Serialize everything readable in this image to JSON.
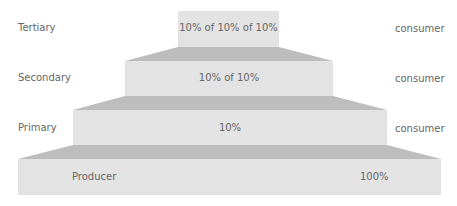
{
  "diagram": {
    "type": "energy pyramid",
    "levels": [
      {
        "left_label": "Tertiary",
        "value": "10% of 10% of 10%",
        "right_label": "consumer"
      },
      {
        "left_label": "Secondary",
        "value": "10% of 10%",
        "right_label": "consumer"
      },
      {
        "left_label": "Primary",
        "value": "10%",
        "right_label": "consumer"
      },
      {
        "left_label": "Producer",
        "value": "100%",
        "right_label": ""
      }
    ],
    "colors": {
      "face": "#e3e3e3",
      "top": "#bdbdbd",
      "text": "#666666"
    }
  }
}
